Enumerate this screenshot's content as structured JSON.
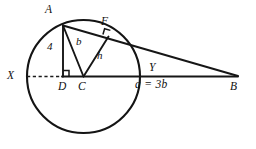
{
  "figure": {
    "kind": "geometry-diagram",
    "ink_color": "#161616",
    "background_color": "#ffffff"
  },
  "points": {
    "A": {
      "label": "A",
      "x": 63,
      "y": 25,
      "label_x": 45,
      "label_y": 5
    },
    "F": {
      "label": "F",
      "x": 108,
      "y": 36,
      "label_x": 102,
      "label_y": 18
    },
    "X": {
      "label": "X",
      "x": 27,
      "y": 76.5,
      "label_x": 8,
      "label_y": 70
    },
    "D": {
      "label": "D",
      "x": 63,
      "y": 76.5,
      "label_x": 59,
      "label_y": 81
    },
    "C": {
      "label": "C",
      "x": 83.5,
      "y": 76.5,
      "label_x": 79,
      "label_y": 81
    },
    "Y": {
      "label": "Y",
      "x": 140,
      "y": 76.5,
      "label_x": 150,
      "label_y": 63
    },
    "B": {
      "label": "B",
      "x": 238,
      "y": 76.5,
      "label_x": 231,
      "label_y": 81
    }
  },
  "measures": {
    "ad_label": "4",
    "ad_label_x": 48,
    "ad_label_y": 41,
    "ca_label": "b",
    "ca_label_x": 77,
    "ca_label_y": 37,
    "cf_label": "h",
    "cf_label_x": 98,
    "cf_label_y": 51,
    "base_equation": "a = 3b",
    "base_equation_x": 136,
    "base_equation_y": 80
  },
  "circle": {
    "center_x": 83.5,
    "center_y": 76.5,
    "radius": 56.5
  },
  "segments": [
    {
      "name": "segment-XD-dashed",
      "from": "X",
      "to": "D",
      "style": "dashed"
    },
    {
      "name": "segment-DB-baseline",
      "from": "D",
      "to": "B",
      "style": "solid"
    },
    {
      "name": "segment-AD-altitude",
      "from": "A",
      "to": "D",
      "style": "solid"
    },
    {
      "name": "segment-AC-radius",
      "from": "A",
      "to": "C",
      "style": "solid"
    },
    {
      "name": "segment-AB-secant",
      "from": "A",
      "to": "B",
      "style": "solid"
    },
    {
      "name": "segment-CF-perpendicular",
      "from": "C",
      "to": "F",
      "style": "solid"
    }
  ],
  "right_angles": [
    {
      "name": "right-angle-at-D",
      "vertex": "D"
    },
    {
      "name": "right-angle-at-F",
      "vertex": "F"
    }
  ]
}
